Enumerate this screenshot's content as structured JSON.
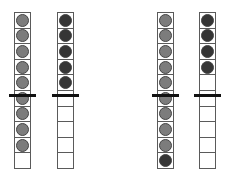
{
  "diagram": {
    "type": "ten-frame-columns",
    "cells_per_column": 10,
    "divider_after_cell": 5,
    "colors": {
      "gray": "#7c7c7c",
      "dark": "#353535",
      "border": "#5a5a5a",
      "divider": "#111111"
    },
    "columns": [
      {
        "x": 14,
        "cells": [
          "gray",
          "gray",
          "gray",
          "gray",
          "gray",
          "gray",
          "gray",
          "gray",
          "gray",
          "empty"
        ]
      },
      {
        "x": 57,
        "cells": [
          "dark",
          "dark",
          "dark",
          "dark",
          "dark",
          "empty",
          "empty",
          "empty",
          "empty",
          "empty"
        ]
      },
      {
        "x": 157,
        "cells": [
          "gray",
          "gray",
          "gray",
          "gray",
          "gray",
          "gray",
          "gray",
          "gray",
          "gray",
          "dark"
        ]
      },
      {
        "x": 199,
        "cells": [
          "dark",
          "dark",
          "dark",
          "dark",
          "empty",
          "empty",
          "empty",
          "empty",
          "empty",
          "empty"
        ]
      }
    ]
  }
}
